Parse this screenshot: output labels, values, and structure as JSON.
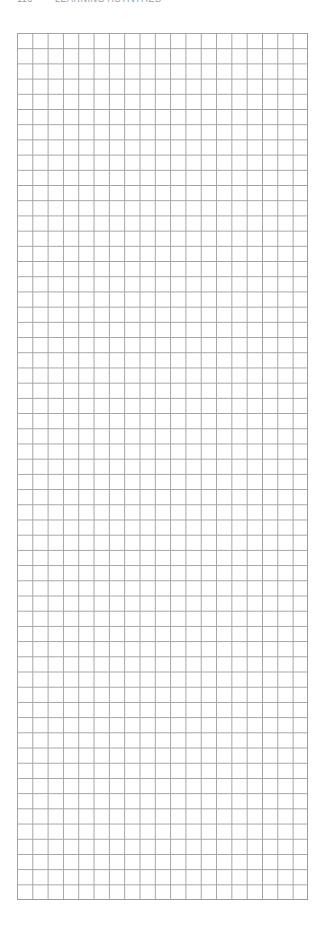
{
  "header": {
    "page_number": "116",
    "title": "LEARNING ACTIVITIES"
  },
  "grid": {
    "columns": 19,
    "rows": 57,
    "line_color": "#a3a3a3",
    "background_color": "#ffffff"
  }
}
